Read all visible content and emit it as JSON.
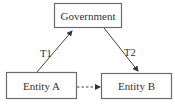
{
  "diagram": {
    "nodes": [
      {
        "id": "government",
        "label": "Government"
      },
      {
        "id": "entity_a",
        "label": "Entity A"
      },
      {
        "id": "entity_b",
        "label": "Entity B"
      }
    ],
    "edges": [
      {
        "from": "entity_a",
        "to": "government",
        "label": "T1",
        "style": "solid"
      },
      {
        "from": "government",
        "to": "entity_b",
        "label": "T2",
        "style": "solid"
      },
      {
        "from": "entity_a",
        "to": "entity_b",
        "label": "",
        "style": "dashed"
      }
    ],
    "colors": {
      "stroke": "#6b6b6b",
      "text": "#333333",
      "background": "#ffffff"
    }
  }
}
